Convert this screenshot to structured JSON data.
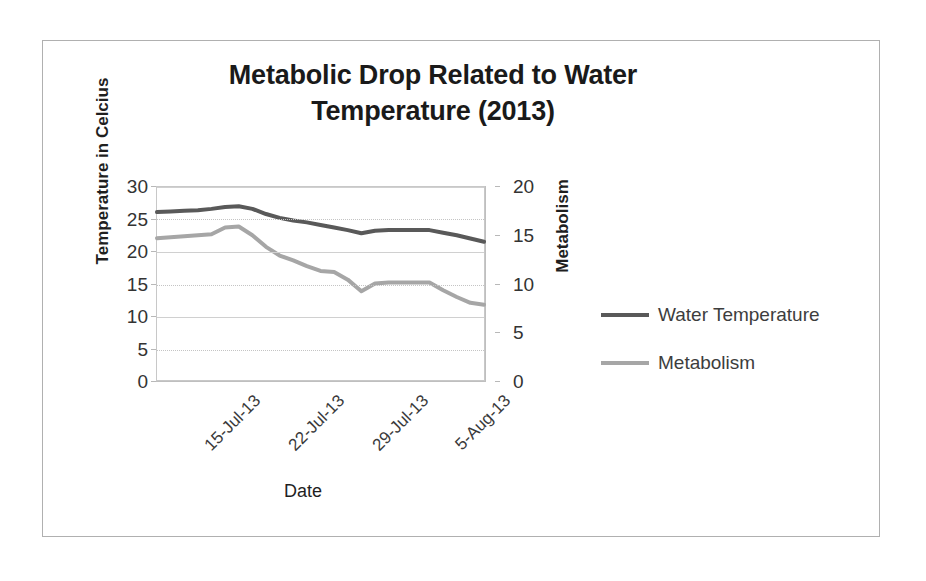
{
  "chart_data": {
    "type": "line",
    "title": "Metabolic Drop Related to Water Temperature (2013)",
    "title_line1": "Metabolic Drop Related to Water",
    "title_line2": "Temperature (2013)",
    "xlabel": "Date",
    "ylabel": "Temperature in Celcius",
    "y2label": "Metabolism",
    "grid": true,
    "legend_position": "right",
    "ylim": [
      0,
      30
    ],
    "y2lim": [
      0,
      20
    ],
    "yticks": [
      "0",
      "5",
      "10",
      "15",
      "20",
      "25",
      "30"
    ],
    "y2ticks": [
      "0",
      "5",
      "10",
      "15",
      "20"
    ],
    "categories": [
      "15-Jul-13",
      "22-Jul-13",
      "29-Jul-13",
      "5-Aug-13"
    ],
    "xticks": [
      "15-Jul-13",
      "22-Jul-13",
      "29-Jul-13",
      "5-Aug-13"
    ],
    "series": [
      {
        "name": "Water Temperature",
        "axis": "left",
        "color": "#595959",
        "units": "Celcius",
        "x": [
          0,
          1,
          2,
          3,
          4,
          5,
          6,
          7,
          8,
          9,
          10,
          11,
          12,
          13,
          14,
          15,
          16,
          17,
          18,
          19,
          20,
          21,
          22,
          23,
          24
        ],
        "values": [
          26.1,
          26.2,
          26.3,
          26.4,
          26.6,
          26.9,
          27.0,
          26.6,
          25.8,
          25.2,
          24.8,
          24.5,
          24.1,
          23.7,
          23.3,
          22.8,
          23.2,
          23.3,
          23.3,
          23.3,
          23.3,
          22.9,
          22.5,
          22.0,
          21.5
        ]
      },
      {
        "name": "Metabolism",
        "axis": "right",
        "color": "#a6a6a6",
        "x": [
          0,
          1,
          2,
          3,
          4,
          5,
          6,
          7,
          8,
          9,
          10,
          11,
          12,
          13,
          14,
          15,
          16,
          17,
          18,
          19,
          20,
          21,
          22,
          23,
          24
        ],
        "values": [
          14.7,
          14.8,
          14.9,
          15.0,
          15.1,
          15.8,
          15.9,
          15.0,
          13.8,
          12.9,
          12.4,
          11.8,
          11.3,
          11.2,
          10.4,
          9.2,
          10.0,
          10.1,
          10.1,
          10.1,
          10.1,
          9.3,
          8.6,
          8.0,
          7.8
        ]
      }
    ],
    "legend": [
      {
        "label": "Water Temperature",
        "color": "#595959"
      },
      {
        "label": "Metabolism",
        "color": "#a6a6a6"
      }
    ]
  }
}
